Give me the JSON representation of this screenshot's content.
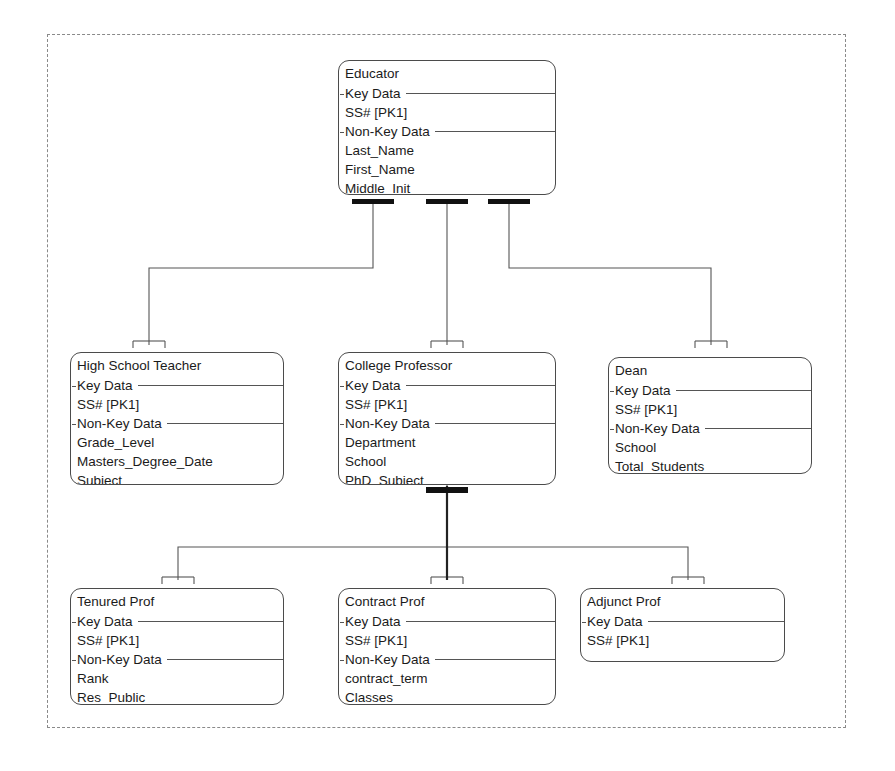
{
  "diagram": {
    "notation": "IDEF1X",
    "frame_style": "dashed",
    "colors": {
      "background": "#ffffff",
      "box_border": "#4b4b4b",
      "line": "#555555",
      "category_bar": "#111111",
      "frame": "#8a8a8a",
      "text": "#1b1b1b"
    },
    "section_labels": {
      "key_data": "Key Data",
      "non_key_data": "Non-Key Data"
    },
    "entities": [
      {
        "id": "educator",
        "name": "Educator",
        "key_data_label": "Key Data",
        "key_attributes": [
          "SS#   [PK1]"
        ],
        "non_key_data_label": "Non-Key Data",
        "non_key_attributes": [
          "Last_Name",
          "First_Name",
          "Middle_Init"
        ]
      },
      {
        "id": "high-school-teacher",
        "name": "High School Teacher",
        "key_data_label": "Key Data",
        "key_attributes": [
          "SS#   [PK1]"
        ],
        "non_key_data_label": "Non-Key Data",
        "non_key_attributes": [
          "Grade_Level",
          "Masters_Degree_Date",
          "Subject"
        ]
      },
      {
        "id": "college-professor",
        "name": "College Professor",
        "key_data_label": "Key Data",
        "key_attributes": [
          "SS#   [PK1]"
        ],
        "non_key_data_label": "Non-Key Data",
        "non_key_attributes": [
          "Department",
          "School",
          "PhD_Subject"
        ]
      },
      {
        "id": "dean",
        "name": "Dean",
        "key_data_label": "Key Data",
        "key_attributes": [
          "SS#   [PK1]"
        ],
        "non_key_data_label": "Non-Key Data",
        "non_key_attributes": [
          "School",
          "Total_Students"
        ]
      },
      {
        "id": "tenured-prof",
        "name": "Tenured Prof",
        "key_data_label": "Key Data",
        "key_attributes": [
          "SS#   [PK1]"
        ],
        "non_key_data_label": "Non-Key Data",
        "non_key_attributes": [
          "Rank",
          "Res_Public"
        ]
      },
      {
        "id": "contract-prof",
        "name": "Contract Prof",
        "key_data_label": "Key Data",
        "key_attributes": [
          "SS#   [PK1]"
        ],
        "non_key_data_label": "Non-Key Data",
        "non_key_attributes": [
          "contract_term",
          "Classes"
        ]
      },
      {
        "id": "adjunct-prof",
        "name": "Adjunct Prof",
        "key_data_label": "Key Data",
        "key_attributes": [
          "SS#   [PK1]"
        ],
        "non_key_data_label": null,
        "non_key_attributes": []
      }
    ],
    "relationships": [
      {
        "from": "educator",
        "to": "high-school-teacher",
        "type": "category-subtype"
      },
      {
        "from": "educator",
        "to": "college-professor",
        "type": "category-subtype"
      },
      {
        "from": "educator",
        "to": "dean",
        "type": "category-subtype"
      },
      {
        "from": "college-professor",
        "to": "tenured-prof",
        "type": "category-subtype"
      },
      {
        "from": "college-professor",
        "to": "contract-prof",
        "type": "category-subtype"
      },
      {
        "from": "college-professor",
        "to": "adjunct-prof",
        "type": "category-subtype"
      }
    ]
  }
}
